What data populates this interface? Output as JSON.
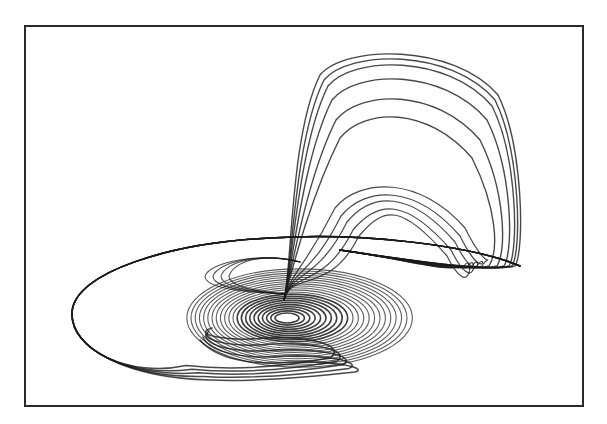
{
  "chart_data": {
    "type": "line",
    "title": "",
    "xlabel": "",
    "ylabel": "",
    "grid": false,
    "legend": null,
    "frame": {
      "x": 24,
      "y": 25,
      "width": 556,
      "height": 378
    },
    "colors": {
      "line": "#1a1a1a",
      "frame": "#2a2a2a",
      "background": "#ffffff"
    },
    "spiral_center": {
      "x": 287,
      "y": 318
    },
    "spiral_rings": 22,
    "outer_bands": 5,
    "arch_loops": 11
  }
}
